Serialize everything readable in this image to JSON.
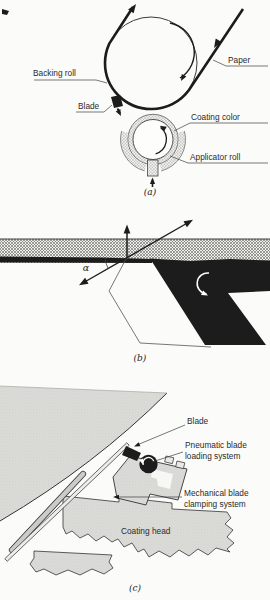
{
  "figure": {
    "type": "technical-diagram",
    "panels": {
      "a": {
        "caption": "(a)",
        "labels": {
          "backing_roll": "Backing roll",
          "paper": "Paper",
          "blade": "Blade",
          "coating_color": "Coating color",
          "applicator_roll": "Applicator roll"
        }
      },
      "b": {
        "caption": "(b)",
        "angle": "α"
      },
      "c": {
        "caption": "(c)",
        "labels": {
          "blade": "Blade",
          "pneumatic_1": "Pneumatic blade",
          "pneumatic_2": "loading system",
          "mechanical_1": "Mechanical blade",
          "mechanical_2": "clamping system",
          "coating_head": "Coating head"
        }
      }
    },
    "colors": {
      "ink": "#1c1c1c",
      "paper_bg": "#fbfbf9",
      "roll_gray": "#d9d9d5",
      "label_text": "#2b2b2b"
    }
  }
}
